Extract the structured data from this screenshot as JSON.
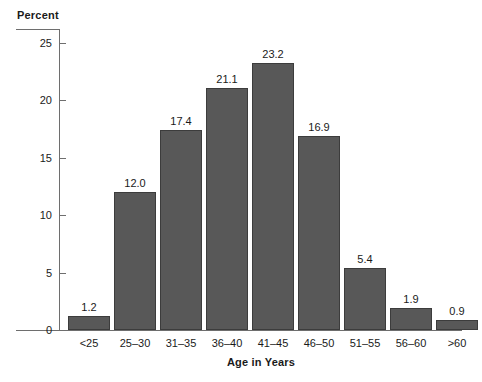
{
  "chart_data": {
    "type": "bar",
    "title": "",
    "xlabel": "Age in Years",
    "ylabel": "Percent",
    "categories": [
      "<25",
      "25–30",
      "31–35",
      "36–40",
      "41–45",
      "46–50",
      "51–55",
      "56–60",
      ">60"
    ],
    "values": [
      1.2,
      12.0,
      17.4,
      21.1,
      23.2,
      16.9,
      5.4,
      1.9,
      0.9
    ],
    "value_labels": [
      "1.2",
      "12.0",
      "17.4",
      "21.1",
      "23.2",
      "16.9",
      "5.4",
      "1.9",
      "0.9"
    ],
    "ylim": [
      0,
      25
    ],
    "ytick_values": [
      0,
      5,
      10,
      15,
      20,
      25
    ],
    "ytick_labels": [
      "0",
      "5",
      "10",
      "15",
      "20",
      "25"
    ],
    "grid": false,
    "legend": null,
    "bar_color": "#585858",
    "bar_edge_color": "#3c3c3c",
    "axis_color": "#6e6e6e",
    "text_color": "#1a1a1a"
  }
}
